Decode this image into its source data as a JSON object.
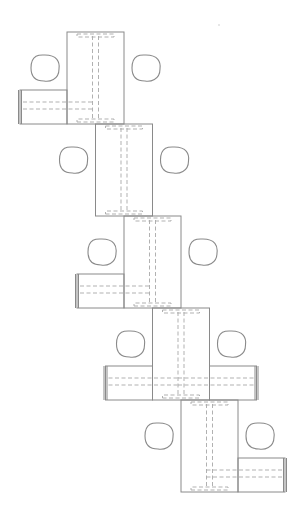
{
  "diagram": {
    "title": "",
    "colors": {
      "line": "#8a8a8a",
      "hidden_line": "#a8a8a8",
      "background": "#ffffff"
    },
    "modules": [
      {
        "id": "module-1",
        "stub_side": "left",
        "pads": 2
      },
      {
        "id": "module-2",
        "stub_side": "none",
        "pads": 2
      },
      {
        "id": "module-3",
        "stub_side": "left",
        "pads": 2
      },
      {
        "id": "module-4",
        "stub_side": "both",
        "pads": 2
      },
      {
        "id": "module-5",
        "stub_side": "right",
        "pads": 2
      }
    ]
  }
}
